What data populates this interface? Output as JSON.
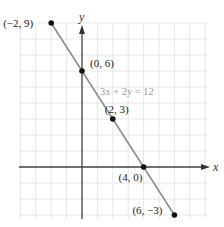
{
  "chart_data": {
    "type": "line",
    "title": "",
    "xlabel": "x",
    "ylabel": "y",
    "xlim": [
      -4,
      8
    ],
    "ylim": [
      -3.5,
      9.5
    ],
    "grid": true,
    "equation_label": "3x + 2y = 12",
    "series": [
      {
        "name": "3x + 2y = 12",
        "points": [
          {
            "x": -2,
            "y": 9,
            "label": "(−2, 9)"
          },
          {
            "x": 0,
            "y": 6,
            "label": "(0, 6)"
          },
          {
            "x": 2,
            "y": 3,
            "label": "(2, 3)"
          },
          {
            "x": 4,
            "y": 0,
            "label": "(4, 0)"
          },
          {
            "x": 6,
            "y": -3,
            "label": "(6, −3)"
          }
        ]
      }
    ]
  },
  "colors": {
    "line": "#8c8c8c",
    "grid": "#e6e6e6",
    "axis": "#444444",
    "point": "#111111",
    "equation": "#9a9a9a"
  }
}
